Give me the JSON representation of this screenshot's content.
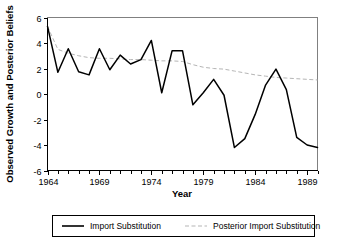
{
  "chart_data": {
    "type": "line",
    "title": "",
    "xlabel": "Year",
    "ylabel": "Observed Growth and Posterior Beliefs",
    "xlim": [
      1964,
      1990
    ],
    "ylim": [
      -6,
      6
    ],
    "grid": false,
    "legend_position": "bottom-outside",
    "xticks": [
      1964,
      1969,
      1974,
      1979,
      1984,
      1989
    ],
    "xticklabels": [
      "1964",
      "1969",
      "1974",
      "1979",
      "1984",
      "1989"
    ],
    "xminorticks": [
      1965,
      1966,
      1967,
      1968,
      1970,
      1971,
      1972,
      1973,
      1975,
      1976,
      1977,
      1978,
      1980,
      1981,
      1982,
      1983,
      1985,
      1986,
      1987,
      1988,
      1990
    ],
    "yticks": [
      -6,
      -4,
      -2,
      0,
      2,
      4,
      6
    ],
    "yticklabels": [
      "-6",
      "-4",
      "-2",
      "0",
      "2",
      "4",
      "6"
    ],
    "x": [
      1964,
      1965,
      1966,
      1967,
      1968,
      1969,
      1970,
      1971,
      1972,
      1973,
      1974,
      1975,
      1976,
      1977,
      1978,
      1979,
      1980,
      1981,
      1982,
      1983,
      1984,
      1985,
      1986,
      1987,
      1988,
      1989,
      1990
    ],
    "series": [
      {
        "name": "Import Substitution",
        "color": "#000000",
        "style": "solid",
        "values": [
          5.3,
          1.7,
          3.55,
          1.75,
          1.5,
          3.55,
          1.9,
          3.05,
          2.35,
          2.7,
          4.2,
          0.1,
          3.4,
          3.4,
          -0.85,
          0.1,
          1.15,
          -0.1,
          -4.2,
          -3.5,
          -1.6,
          0.7,
          1.95,
          0.35,
          -3.4,
          -4.0,
          -4.2
        ]
      },
      {
        "name": "Posterior Import Substitution",
        "color": "#b5b5b5",
        "style": "dashed",
        "values": [
          5.3,
          3.5,
          3.2,
          3.0,
          2.85,
          2.8,
          2.8,
          2.75,
          2.7,
          2.7,
          2.65,
          2.6,
          2.6,
          2.55,
          2.3,
          2.1,
          2.0,
          1.95,
          1.8,
          1.65,
          1.5,
          1.4,
          1.3,
          1.25,
          1.2,
          1.15,
          1.1
        ]
      }
    ]
  },
  "legend": {
    "items": [
      {
        "label": "Import Substitution",
        "color": "#000000",
        "style": "solid"
      },
      {
        "label": "Posterior Import Substitution",
        "color": "#b5b5b5",
        "style": "dashed"
      }
    ]
  }
}
